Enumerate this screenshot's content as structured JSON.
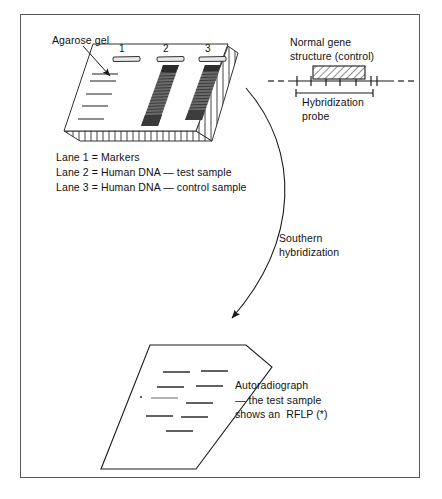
{
  "figure": {
    "title_labels": {
      "agarose_gel": "Agarose gel",
      "normal_gene": "Normal gene\nstructure (control)",
      "hybridization_probe": "Hybridization\nprobe",
      "southern_hybridization": "Southern\nhybridization",
      "autoradiograph": "Autoradiograph\n— the test sample\nshows an  RFLP (*)"
    },
    "gel": {
      "lane_numbers": [
        "1",
        "2",
        "3"
      ],
      "legend": "Lane 1 = Markers\nLane 2 = Human DNA — test sample\nLane 3 = Human DNA — control sample",
      "lane_1_marker_bands": 5,
      "lane_2_type": "smear",
      "lane_3_type": "smear"
    },
    "gene_map": {
      "tick_count_left": 2,
      "tick_count_under_box": 3,
      "tick_count_right": 3,
      "box_fill": "hatched",
      "line_style": "dashed-ends"
    },
    "autoradiograph": {
      "left_column_band_count": 4,
      "right_column_band_count": 4,
      "rflp_marker": "*"
    },
    "colors": {
      "ink": "#1a1a1a",
      "frame": "#555555",
      "gel_face": "#ffffff",
      "smear": "#5a5a5a",
      "faint_band": "#9a9a9a"
    }
  }
}
